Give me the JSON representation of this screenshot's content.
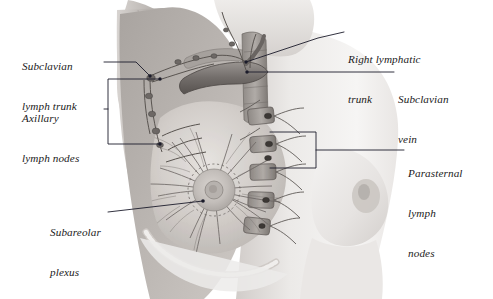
{
  "figure": {
    "style": "grayscale medical illustration",
    "background_color": "#ffffff",
    "leader_color": "#1b1b2a"
  },
  "labels": [
    {
      "id": "subclavian-lymph-trunk",
      "lines": [
        "Subclavian",
        "lymph trunk"
      ],
      "x": 22,
      "y": 33,
      "align": "left"
    },
    {
      "id": "axillary-lymph-nodes",
      "lines": [
        "Axillary",
        "lymph nodes"
      ],
      "x": 22,
      "y": 85,
      "align": "left"
    },
    {
      "id": "subareolar-plexus",
      "lines": [
        "Subareolar",
        "plexus"
      ],
      "x": 50,
      "y": 199,
      "align": "left"
    },
    {
      "id": "right-lymphatic-trunk",
      "lines": [
        "Right lymphatic",
        "trunk"
      ],
      "x": 348,
      "y": 26,
      "align": "left"
    },
    {
      "id": "subclavian-vein",
      "lines": [
        "Subclavian",
        "vein"
      ],
      "x": 398,
      "y": 66,
      "align": "left"
    },
    {
      "id": "parasternal-lymph-nodes",
      "lines": [
        "Parasternal",
        "lymph",
        "nodes"
      ],
      "x": 408,
      "y": 140,
      "align": "left"
    }
  ],
  "anatomy_parts": [
    "subclavian lymph trunk",
    "right lymphatic trunk",
    "subclavian vein",
    "axillary lymph nodes",
    "parasternal lymph nodes",
    "subareolar plexus",
    "areola and nipple",
    "intercostal lymphatic vessels",
    "ribs",
    "pectoral muscle",
    "contralateral breast"
  ],
  "colors": {
    "skin_light": "#f2f0ef",
    "skin_mid": "#ddd9d7",
    "skin_shadow": "#c4bfbc",
    "tissue_mid": "#b5b0ac",
    "tissue_dark": "#8f8a86",
    "vessel": "#6e6a67",
    "vessel_dark": "#4a4643",
    "node": "#3c3835",
    "leader": "#1b1b2a"
  }
}
